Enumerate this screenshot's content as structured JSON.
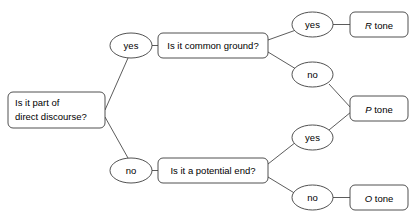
{
  "diagram": {
    "type": "decision-tree",
    "colors": {
      "background": "#ffffff",
      "stroke": "#3d3d3d",
      "edge": "#4a4a4a",
      "text": "#000000"
    },
    "nodes": {
      "root": {
        "id": "root",
        "kind": "decision-box",
        "line1": "Is it part of",
        "line2": "direct discourse?"
      },
      "common_ground": {
        "id": "common-ground",
        "kind": "decision-box",
        "label": "Is it common ground?"
      },
      "potential_end": {
        "id": "potential-end",
        "kind": "decision-box",
        "label": "Is it a potential end?"
      },
      "root_yes": {
        "id": "root-yes",
        "kind": "branch-oval",
        "label": "yes"
      },
      "root_no": {
        "id": "root-no",
        "kind": "branch-oval",
        "label": "no"
      },
      "cg_yes": {
        "id": "common-ground-yes",
        "kind": "branch-oval",
        "label": "yes"
      },
      "cg_no": {
        "id": "common-ground-no",
        "kind": "branch-oval",
        "label": "no"
      },
      "pe_yes": {
        "id": "potential-end-yes",
        "kind": "branch-oval",
        "label": "yes"
      },
      "pe_no": {
        "id": "potential-end-no",
        "kind": "branch-oval",
        "label": "no"
      },
      "r_tone": {
        "id": "r-tone",
        "kind": "outcome-box",
        "symbol": "R",
        "suffix": " tone"
      },
      "p_tone": {
        "id": "p-tone",
        "kind": "outcome-box",
        "symbol": "P",
        "suffix": " tone"
      },
      "o_tone": {
        "id": "o-tone",
        "kind": "outcome-box",
        "symbol": "O",
        "suffix": " tone"
      }
    },
    "edges": [
      {
        "from": "root",
        "to": "root_yes",
        "label": ""
      },
      {
        "from": "root",
        "to": "root_no",
        "label": ""
      },
      {
        "from": "root_yes",
        "to": "common_ground",
        "label": ""
      },
      {
        "from": "root_no",
        "to": "potential_end",
        "label": ""
      },
      {
        "from": "common_ground",
        "to": "cg_yes",
        "label": ""
      },
      {
        "from": "common_ground",
        "to": "cg_no",
        "label": ""
      },
      {
        "from": "cg_yes",
        "to": "r_tone",
        "label": ""
      },
      {
        "from": "cg_no",
        "to": "p_tone",
        "label": ""
      },
      {
        "from": "potential_end",
        "to": "pe_yes",
        "label": ""
      },
      {
        "from": "potential_end",
        "to": "pe_no",
        "label": ""
      },
      {
        "from": "pe_yes",
        "to": "p_tone",
        "label": ""
      },
      {
        "from": "pe_no",
        "to": "o_tone",
        "label": ""
      }
    ]
  }
}
